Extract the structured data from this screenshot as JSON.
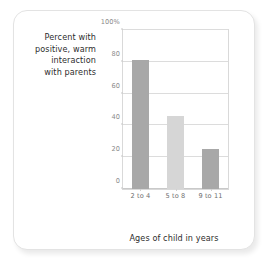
{
  "figure": {
    "card_border_color": "#e3e3e3",
    "background_color": "#ffffff"
  },
  "y_caption": {
    "line1": "Percent with",
    "line2": "positive, warm",
    "line3": "interaction",
    "line4": "with parents"
  },
  "chart_data": {
    "type": "bar",
    "title": "",
    "xlabel": "Ages of child in years",
    "ylabel": "Percent with positive, warm interaction with parents",
    "categories": [
      "2 to 4",
      "5 to 8",
      "9 to 11"
    ],
    "values": [
      81,
      46,
      25
    ],
    "ylim": [
      0,
      100
    ],
    "ytick_values": [
      0,
      20,
      40,
      60,
      80,
      100
    ],
    "ytick_labels": [
      "0",
      "20",
      "40",
      "60",
      "80",
      "100%"
    ],
    "grid": true,
    "legend": "none",
    "bar_colors": [
      "#a8a8a8",
      "#d6d6d6",
      "#a8a8a8"
    ],
    "series": [
      {
        "name": "Percent with positive, warm interaction with parents",
        "values": [
          81,
          46,
          25
        ]
      }
    ]
  }
}
